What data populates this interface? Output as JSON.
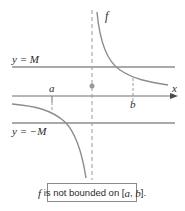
{
  "figure": {
    "function_label": "f",
    "x_axis_label": "x",
    "upper_bound_label": "y = M",
    "lower_bound_label": "y = −M",
    "point_a_label": "a",
    "point_b_label": "b",
    "caption": {
      "prefix_italic": "f",
      "text": " is not bounded on [",
      "a": "a",
      "sep": ", ",
      "b": "b",
      "suffix": "]."
    },
    "colors": {
      "curve": "#8c8c8c",
      "bound_lines": "#8c8c8c",
      "axis": "#6e6e6e",
      "asymptote": "#9a9a9a",
      "dot": "#9a9a9a",
      "text": "#2b2b2b"
    }
  }
}
